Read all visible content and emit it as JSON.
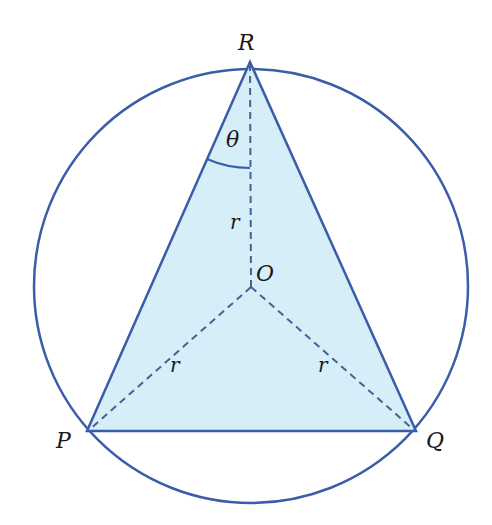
{
  "diagram": {
    "colors": {
      "stroke": "#3b5ca8",
      "fill": "#d6eef8",
      "dashed": "#4a6090",
      "text": "#1a1a1a"
    },
    "circle": {
      "cx": 251,
      "cy": 286,
      "r": 217
    },
    "points": {
      "R": {
        "x": 250,
        "y": 62,
        "label": "R"
      },
      "P": {
        "x": 87,
        "y": 431,
        "label": "P"
      },
      "Q": {
        "x": 416,
        "y": 431,
        "label": "Q"
      },
      "O": {
        "x": 251,
        "y": 287,
        "label": "O"
      }
    },
    "labels": {
      "R": "R",
      "P": "P",
      "Q": "Q",
      "O": "O",
      "angle": "θ",
      "radius_OR": "r",
      "radius_OP": "r",
      "radius_OQ": "r"
    }
  }
}
